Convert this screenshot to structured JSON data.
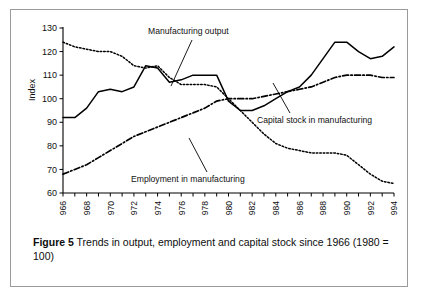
{
  "figure": {
    "caption_label": "Figure 5",
    "caption_text": "Trends in output, employment and capital stock since 1966 (1980 = 100)"
  },
  "annotations": {
    "output": "Manufacturing output",
    "capital": "Capital stock in manufacturing",
    "employment": "Employment in manufacturing"
  },
  "chart_data": {
    "type": "line",
    "title": "",
    "xlabel": "",
    "ylabel": "Index",
    "ylim": [
      60,
      130
    ],
    "xlim": [
      1966,
      1994
    ],
    "yticks": [
      60,
      70,
      80,
      90,
      100,
      110,
      120,
      130
    ],
    "xticks": [
      1966,
      1968,
      1970,
      1972,
      1974,
      1976,
      1978,
      1980,
      1982,
      1984,
      1986,
      1988,
      1990,
      1992,
      1994
    ],
    "xtick_labels": [
      "1966",
      "1968",
      "1970",
      "1972",
      "1974",
      "1976",
      "1978",
      "1980",
      "1982",
      "1984",
      "1986",
      "1988",
      "1990",
      "1992",
      "1994"
    ],
    "grid": false,
    "legend_position": "inline-annotations",
    "x": [
      1966,
      1967,
      1968,
      1969,
      1970,
      1971,
      1972,
      1973,
      1974,
      1975,
      1976,
      1977,
      1978,
      1979,
      1980,
      1981,
      1982,
      1983,
      1984,
      1985,
      1986,
      1987,
      1988,
      1989,
      1990,
      1991,
      1992,
      1993,
      1994
    ],
    "series": [
      {
        "name": "Manufacturing output",
        "style": "solid",
        "color": "#000000",
        "values": [
          92,
          92,
          96,
          103,
          104,
          103,
          105,
          114,
          113,
          107,
          108,
          110,
          110,
          110,
          99,
          95,
          95,
          97,
          100,
          103,
          105,
          110,
          117,
          124,
          124,
          120,
          117,
          118,
          122
        ]
      },
      {
        "name": "Employment in manufacturing",
        "style": "dotted",
        "color": "#000000",
        "values": [
          124,
          122,
          121,
          120,
          120,
          118,
          114,
          113,
          114,
          109,
          106,
          106,
          106,
          105,
          100,
          95,
          90,
          85,
          81,
          79,
          78,
          77,
          77,
          77,
          76,
          72,
          68,
          65,
          64
        ]
      },
      {
        "name": "Capital stock in manufacturing",
        "style": "dash-dot",
        "color": "#000000",
        "values": [
          68,
          70,
          72,
          75,
          78,
          81,
          84,
          86,
          88,
          90,
          92,
          94,
          96,
          99,
          100,
          100,
          100,
          101,
          102,
          103,
          104,
          105,
          107,
          109,
          110,
          110,
          110,
          109,
          109
        ]
      }
    ]
  }
}
